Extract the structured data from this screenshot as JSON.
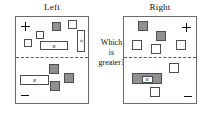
{
  "diagram": {
    "question": {
      "line1": "Which",
      "line2": "is",
      "line3": "greater?"
    },
    "signs": {
      "positive": "+",
      "negative": "−"
    },
    "variable_label": "x",
    "colors": {
      "tile_white": "#ffffff",
      "tile_gray": "#909090",
      "outline": "#4d4d4d",
      "panel_border": "#6b6b6b",
      "divider": "#5a5a5a",
      "text": "#111111",
      "background": "#ffffff"
    },
    "panels": [
      {
        "id": "left",
        "title": "Left",
        "positive_zone": {
          "sign": "+",
          "sign_position": "top-left",
          "tiles": [
            {
              "kind": "unit",
              "fill": "white",
              "x": 8,
              "y": 22,
              "w": 8,
              "h": 8,
              "label": ""
            },
            {
              "kind": "unit",
              "fill": "white",
              "x": 20,
              "y": 14,
              "w": 8,
              "h": 8,
              "label": ""
            },
            {
              "kind": "unit",
              "fill": "gray",
              "x": 36,
              "y": 5,
              "w": 9,
              "h": 9,
              "label": ""
            },
            {
              "kind": "unit",
              "fill": "white",
              "x": 52,
              "y": 3,
              "w": 9,
              "h": 9,
              "label": ""
            },
            {
              "kind": "x-bar-vertical",
              "fill": "white",
              "x": 61,
              "y": 13,
              "w": 8,
              "h": 22,
              "label": "x"
            },
            {
              "kind": "x-bar-horizontal",
              "fill": "white",
              "x": 24,
              "y": 24,
              "w": 28,
              "h": 9,
              "label": "x"
            }
          ]
        },
        "negative_zone": {
          "sign": "−",
          "sign_position": "bottom-left",
          "tiles": [
            {
              "kind": "unit",
              "fill": "gray",
              "x": 33,
              "y": 7,
              "w": 10,
              "h": 10,
              "label": ""
            },
            {
              "kind": "unit",
              "fill": "gray",
              "x": 48,
              "y": 16,
              "w": 10,
              "h": 10,
              "label": ""
            },
            {
              "kind": "unit",
              "fill": "gray",
              "x": 34,
              "y": 24,
              "w": 10,
              "h": 10,
              "label": ""
            },
            {
              "kind": "x-bar-horizontal",
              "fill": "white",
              "x": 4,
              "y": 18,
              "w": 29,
              "h": 10,
              "label": "x"
            }
          ]
        }
      },
      {
        "id": "right",
        "title": "Right",
        "positive_zone": {
          "sign": "+",
          "sign_position": "top-right",
          "tiles": [
            {
              "kind": "unit",
              "fill": "gray",
              "x": 14,
              "y": 4,
              "w": 10,
              "h": 10,
              "label": ""
            },
            {
              "kind": "unit",
              "fill": "gray",
              "x": 32,
              "y": 14,
              "w": 10,
              "h": 10,
              "label": ""
            },
            {
              "kind": "unit",
              "fill": "white",
              "x": 8,
              "y": 23,
              "w": 10,
              "h": 10,
              "label": ""
            },
            {
              "kind": "unit",
              "fill": "white",
              "x": 27,
              "y": 27,
              "w": 10,
              "h": 10,
              "label": ""
            },
            {
              "kind": "unit",
              "fill": "white",
              "x": 52,
              "y": 23,
              "w": 10,
              "h": 10,
              "label": ""
            }
          ]
        },
        "negative_zone": {
          "sign": "−",
          "sign_position": "bottom-right",
          "tiles": [
            {
              "kind": "unit",
              "fill": "white",
              "x": 45,
              "y": 6,
              "w": 10,
              "h": 10,
              "label": ""
            },
            {
              "kind": "x-bar-horizontal-gray",
              "fill": "gray",
              "x": 8,
              "y": 16,
              "w": 30,
              "h": 11,
              "label": "x"
            },
            {
              "kind": "unit",
              "fill": "white",
              "x": 26,
              "y": 30,
              "w": 10,
              "h": 10,
              "label": ""
            }
          ]
        }
      }
    ]
  }
}
